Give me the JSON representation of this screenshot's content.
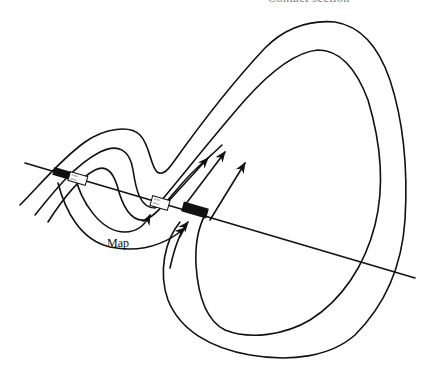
{
  "figure": {
    "title_clipped": "Contact section",
    "labels": {
      "map": "Map"
    },
    "elements": {
      "section_line": "straight section line crossing the folded layer",
      "outer_contact": "outer contact line of folded layer",
      "inner_contact": "inner contact line of folded layer",
      "outcrop_markers": [
        {
          "type": "solid",
          "description": "solid black outcrop bar on left crossing"
        },
        {
          "type": "patterned",
          "description": "patterned outcrop box on left crossing"
        },
        {
          "type": "patterned",
          "description": "patterned outcrop box center"
        },
        {
          "type": "solid",
          "description": "solid black outcrop bar center-right"
        }
      ],
      "arrows_count": 5
    },
    "colors": {
      "ink": "#111111",
      "background": "#ffffff"
    }
  }
}
